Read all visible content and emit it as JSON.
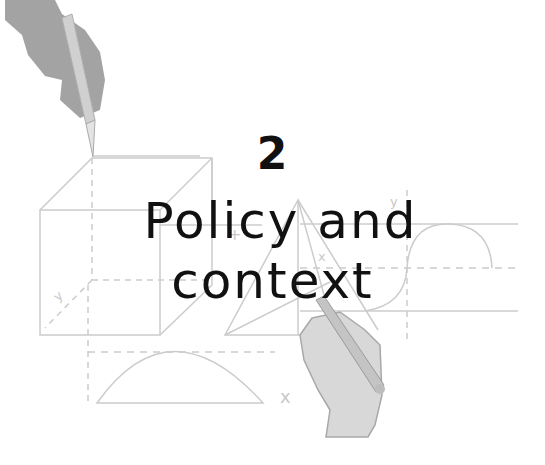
{
  "chapter": {
    "number": "2",
    "title_line1": "Policy and",
    "title_line2": "context"
  },
  "illustration": {
    "axis_labels": {
      "y_cube": "y",
      "y_sine": "y",
      "x_triangle": "x",
      "x_bottom": "x",
      "plus_marker": "+"
    },
    "colors": {
      "line": "#c8c8c8",
      "hand": "#9e9e9e",
      "hand_light": "#d6d6d6",
      "pencil": "#cfcfcf",
      "text": "#111111"
    }
  }
}
